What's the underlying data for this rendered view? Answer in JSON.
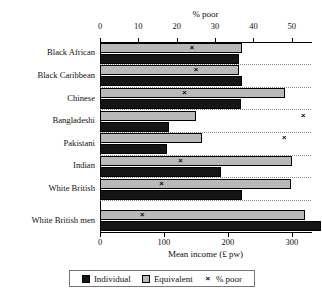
{
  "chart_data": {
    "type": "bar",
    "orientation": "horizontal",
    "title": "",
    "categories": [
      "Black African",
      "Black Caribbean",
      "Chinese",
      "Bangladeshi",
      "Pakistani",
      "Indian",
      "White British",
      "White British men"
    ],
    "series": [
      {
        "name": "Individual",
        "key": "individual",
        "axis": "bottom",
        "color": "#151515",
        "values": [
          218,
          222,
          220,
          108,
          105,
          190,
          222,
          345
        ]
      },
      {
        "name": "Equivalent",
        "key": "equivalent",
        "axis": "bottom",
        "color": "#b9b9b9",
        "values": [
          222,
          218,
          290,
          150,
          160,
          300,
          298,
          320
        ]
      },
      {
        "name": "% poor",
        "key": "poor",
        "axis": "top",
        "marker": "×",
        "values": [
          24,
          25,
          22,
          53,
          48,
          21,
          16,
          11
        ]
      }
    ],
    "bottom_axis": {
      "label": "Mean income (£ pw)",
      "ticks": [
        0,
        100,
        200,
        300
      ],
      "min": 0,
      "max": 330
    },
    "top_axis": {
      "label": "% poor",
      "ticks": [
        0,
        10,
        20,
        30,
        40,
        50
      ],
      "min": 0,
      "max": 55
    },
    "grid": "dotted-horizontal",
    "legend": {
      "position": "bottom",
      "entries": [
        {
          "label": "Individual",
          "swatch": "filled-dark-square"
        },
        {
          "label": "Equivalent",
          "swatch": "filled-grey-square"
        },
        {
          "label": "% poor",
          "swatch": "cross-marker"
        }
      ]
    }
  },
  "caption": ""
}
